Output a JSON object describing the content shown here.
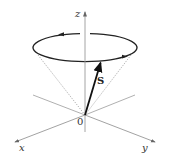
{
  "diagram": {
    "axes": {
      "z_label": "z",
      "x_label": "x",
      "y_label": "y",
      "origin_label": "0"
    },
    "vector": {
      "label": "S"
    },
    "colors": {
      "axis": "#9a9a9a",
      "ellipse": "#222222",
      "vector": "#111111",
      "cone": "#777777"
    }
  }
}
